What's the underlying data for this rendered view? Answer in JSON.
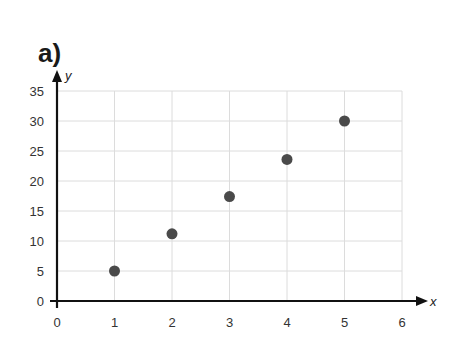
{
  "panel_label": "a)",
  "chart_data": {
    "type": "scatter",
    "title": "",
    "xlabel": "x",
    "ylabel": "y",
    "x": [
      1,
      2,
      3,
      4,
      5
    ],
    "y": [
      5,
      11.2,
      17.4,
      23.6,
      30
    ],
    "series": [
      {
        "name": "points",
        "x": [
          1,
          2,
          3,
          4,
          5
        ],
        "y": [
          5,
          11.2,
          17.4,
          23.6,
          30
        ]
      }
    ],
    "xlim": [
      0,
      6
    ],
    "ylim": [
      0,
      35
    ],
    "xticks": [
      "0",
      "1",
      "2",
      "3",
      "4",
      "5",
      "6"
    ],
    "yticks": [
      "0",
      "5",
      "10",
      "15",
      "20",
      "25",
      "30",
      "35"
    ],
    "grid": true,
    "legend": null,
    "colors": {
      "point": "#4a4a4a",
      "grid": "#dcdcdc",
      "axis": "#111111"
    }
  }
}
